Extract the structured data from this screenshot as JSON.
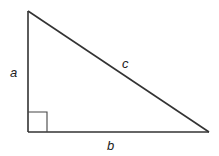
{
  "diagram": {
    "labels": {
      "side_a": "a",
      "side_b": "b",
      "side_c": "c"
    },
    "vertices": {
      "top": [
        28,
        11
      ],
      "right_angle": [
        28,
        132
      ],
      "bottom_right": [
        209,
        132
      ]
    },
    "right_angle_marker_size": 19,
    "stroke_color": "#333333"
  }
}
